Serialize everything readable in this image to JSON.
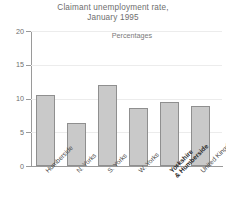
{
  "chart_data": {
    "type": "bar",
    "title": "Claimant unemployment rate, January 1995",
    "title_lines": [
      "Claimant unemployment rate,",
      "January 1995"
    ],
    "subtitle": "Percentages",
    "xlabel": "",
    "ylabel": "",
    "ylim": [
      0,
      20
    ],
    "yticks": [
      0,
      5,
      10,
      15,
      20
    ],
    "ytick_labels": [
      "0",
      "5",
      "10",
      "15",
      "20"
    ],
    "grid": true,
    "legend": "none",
    "categories": [
      "Humberside",
      "N. Yorks",
      "S. Yorks",
      "W. Yorks",
      "Yorkshire & Humberside",
      "United Kingdom"
    ],
    "category_lines": [
      [
        "Humberside"
      ],
      [
        "N. Yorks"
      ],
      [
        "S. Yorks"
      ],
      [
        "W. Yorks"
      ],
      [
        "Yorkshire",
        "& Humberside"
      ],
      [
        "United Kingdom"
      ]
    ],
    "values": [
      10.5,
      6.4,
      12.0,
      8.6,
      9.5,
      8.9
    ],
    "bar_color": "#c9c9c9",
    "bar_border_color": "#8f8f8f",
    "emphasis_index": 4
  }
}
